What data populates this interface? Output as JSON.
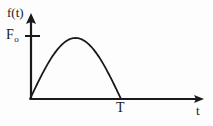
{
  "figure": {
    "background_color": "#fdfdfd",
    "stroke_color": "#1a1a1a",
    "y_axis_label": "f(t)",
    "x_axis_label": "t",
    "amplitude_label_base": "F",
    "amplitude_label_sub": "o",
    "period_label": "T"
  },
  "chart_data": {
    "type": "line",
    "title": "",
    "subtitle": "",
    "xlabel": "t",
    "ylabel": "f(t)",
    "grid": false,
    "legend": null,
    "xlim": [
      0,
      1.45
    ],
    "ylim": [
      0,
      1.18
    ],
    "xticks": [
      1
    ],
    "xticklabels": [
      "T"
    ],
    "yticks": [
      1
    ],
    "yticklabels": [
      "Fo"
    ],
    "series": [
      {
        "name": "f(t)",
        "color": "#1a1a1a",
        "x": [
          0.0,
          0.05,
          0.1,
          0.15,
          0.2,
          0.25,
          0.3,
          0.35,
          0.4,
          0.45,
          0.5,
          0.55,
          0.6,
          0.65,
          0.7,
          0.75,
          0.8,
          0.85,
          0.9,
          0.95,
          1.0
        ],
        "y": [
          0.0,
          0.156,
          0.309,
          0.454,
          0.588,
          0.707,
          0.809,
          0.891,
          0.951,
          0.988,
          1.0,
          0.988,
          0.951,
          0.891,
          0.809,
          0.707,
          0.588,
          0.454,
          0.309,
          0.156,
          0.0
        ]
      }
    ],
    "annotations": [
      {
        "text": "Fo",
        "axis": "y",
        "value": 1,
        "kind": "tick-marker"
      },
      {
        "text": "T",
        "axis": "x",
        "value": 1,
        "kind": "tick-label"
      }
    ]
  },
  "geometry": {
    "origin_x": 30,
    "origin_y": 99,
    "y_axis_top": 14,
    "x_axis_right": 204,
    "peak_x": 78,
    "peak_y": 38,
    "period_x": 121,
    "amplitude_tick_y": 36
  }
}
